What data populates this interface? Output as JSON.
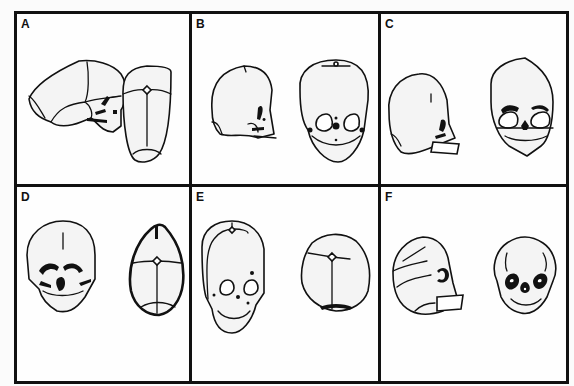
{
  "figure": {
    "panels": [
      {
        "label": "A",
        "views": [
          "lateral-skull",
          "superior-skull"
        ]
      },
      {
        "label": "B",
        "views": [
          "lateral-skull",
          "frontal-skull"
        ]
      },
      {
        "label": "C",
        "views": [
          "lateral-skull",
          "frontal-skull"
        ]
      },
      {
        "label": "D",
        "views": [
          "frontal-skull",
          "superior-skull"
        ]
      },
      {
        "label": "E",
        "views": [
          "frontal-skull",
          "superior-skull"
        ]
      },
      {
        "label": "F",
        "views": [
          "lateral-skull",
          "frontal-skull"
        ]
      }
    ]
  }
}
